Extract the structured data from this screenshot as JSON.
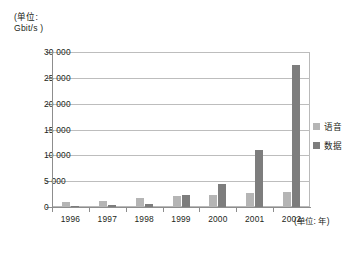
{
  "chart_data": {
    "type": "bar",
    "title": "",
    "unit_caption": "(单位:\nGbit/s )",
    "xlabel": "(单位: 年)",
    "ylabel": "Gbit/s",
    "categories": [
      "1996",
      "1997",
      "1998",
      "1999",
      "2000",
      "2001",
      "2002"
    ],
    "series": [
      {
        "name": "语音",
        "color": "#b5b5b5",
        "values": [
          900,
          1200,
          1700,
          2200,
          2400,
          2700,
          2900
        ]
      },
      {
        "name": "数据",
        "color": "#7d7d7d",
        "values": [
          200,
          300,
          600,
          2300,
          4400,
          11000,
          27500
        ]
      }
    ],
    "ylim": [
      0,
      30000
    ],
    "yticks": [
      0,
      5000,
      10000,
      15000,
      20000,
      25000,
      30000
    ],
    "ytick_labels": [
      "0",
      "5 000",
      "10 000",
      "15 000",
      "20 000",
      "25 000",
      "30 000"
    ],
    "grid": true,
    "legend_position": "right"
  },
  "legend": {
    "items": [
      {
        "label": "语音",
        "color": "#b5b5b5"
      },
      {
        "label": "数据",
        "color": "#7d7d7d"
      }
    ]
  }
}
